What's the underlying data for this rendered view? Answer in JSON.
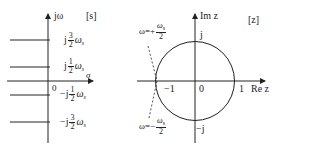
{
  "left_plot": {
    "plane_tag": "[s]",
    "y_axis_label": "jω",
    "x_axis_label": "σ",
    "origin_label": "0",
    "strip_labels": [
      {
        "prefix": "j",
        "num": "3",
        "den": "2",
        "suffix": "ω",
        "sub": "s"
      },
      {
        "prefix": "j",
        "num": "1",
        "den": "2",
        "suffix": "ω",
        "sub": "s"
      },
      {
        "prefix": "−j",
        "num": "1",
        "den": "2",
        "suffix": "ω",
        "sub": "s"
      },
      {
        "prefix": "−j",
        "num": "3",
        "den": "2",
        "suffix": "ω",
        "sub": "s"
      }
    ]
  },
  "right_plot": {
    "plane_tag": "[z]",
    "y_axis_label": "Im z",
    "x_axis_label": "Re z",
    "origin_label": "0",
    "tick_neg1": "−1",
    "tick_pos1": "1",
    "top_label": "j",
    "bottom_label": "−j",
    "upper_note": {
      "prefix": "ω=+",
      "num": "ω",
      "sub": "s",
      "den": "2"
    },
    "lower_note": {
      "prefix": "ω=−",
      "num": "ω",
      "sub": "s",
      "den": "2"
    }
  },
  "colors": {
    "stroke": "#222222",
    "background": "#ffffff"
  }
}
